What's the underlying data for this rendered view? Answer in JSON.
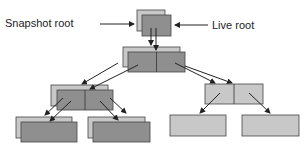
{
  "labels": {
    "snapshot_root": "Snapshot root",
    "live_root": "Live root"
  },
  "colors": {
    "snapshot": "#c8c8c8",
    "live": "#8f8f8f",
    "unshared": "#c8c8c8",
    "stroke": "#333333"
  },
  "nodes": [
    {
      "id": "snap-root",
      "kind": "snapshot",
      "x": 137,
      "y": 10,
      "w": 28,
      "h": 21
    },
    {
      "id": "live-root",
      "kind": "live",
      "x": 142,
      "y": 15,
      "w": 29,
      "h": 21
    },
    {
      "id": "snap-mid",
      "kind": "snapshot",
      "x": 123,
      "y": 47,
      "w": 57,
      "h": 20
    },
    {
      "id": "live-mid",
      "kind": "live",
      "x": 128,
      "y": 52,
      "w": 57,
      "h": 20,
      "split": true
    },
    {
      "id": "snap-left",
      "kind": "snapshot",
      "x": 51,
      "y": 85,
      "w": 57,
      "h": 21
    },
    {
      "id": "live-left",
      "kind": "live",
      "x": 57,
      "y": 90,
      "w": 56,
      "h": 20,
      "split": true
    },
    {
      "id": "right-mid",
      "kind": "unshared",
      "x": 205,
      "y": 84,
      "w": 58,
      "h": 20,
      "split": true
    },
    {
      "id": "snap-leaf1",
      "kind": "snapshot",
      "x": 16,
      "y": 117,
      "w": 56,
      "h": 21
    },
    {
      "id": "live-leaf1",
      "kind": "live",
      "x": 21,
      "y": 122,
      "w": 56,
      "h": 20
    },
    {
      "id": "snap-leaf2",
      "kind": "snapshot",
      "x": 88,
      "y": 117,
      "w": 57,
      "h": 21
    },
    {
      "id": "live-leaf2",
      "kind": "live",
      "x": 93,
      "y": 122,
      "w": 57,
      "h": 20
    },
    {
      "id": "leaf3",
      "kind": "unshared",
      "x": 170,
      "y": 115,
      "w": 56,
      "h": 21
    },
    {
      "id": "leaf4",
      "kind": "unshared",
      "x": 242,
      "y": 115,
      "w": 57,
      "h": 21
    }
  ]
}
